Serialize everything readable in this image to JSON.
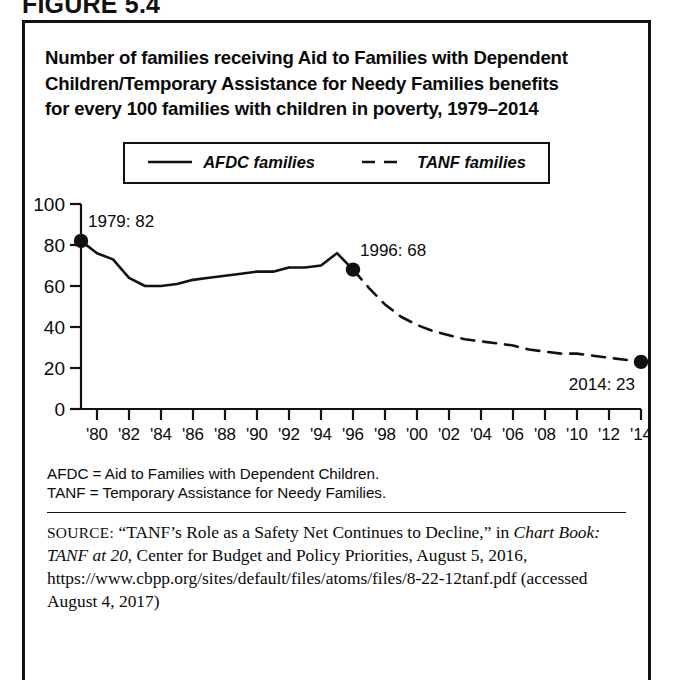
{
  "figure_label": "FIGURE 5.4",
  "title_lines": [
    "Number of families receiving Aid to Families with Dependent",
    "Children/Temporary Assistance for Needy Families benefits",
    "for every 100 families with children in poverty, 1979–2014"
  ],
  "legend": [
    {
      "label": "AFDC families",
      "style": "solid"
    },
    {
      "label": "TANF families",
      "style": "dashed"
    }
  ],
  "abbreviations": [
    "AFDC = Aid to Families with Dependent Children.",
    "TANF = Temporary Assistance for Needy Families."
  ],
  "source": {
    "prefix": "SOURCE:",
    "part1": " “TANF’s Role as a Safety Net Continues to Decline,” in ",
    "italic_title": "Chart Book: TANF at 20",
    "part2": ", Center for Budget and Policy Priorities, August 5, 2016, https://www.cbpp.org/sites/default/files/atoms/files/8-22-12tanf.pdf (accessed August 4, 2017)"
  },
  "chart_data": {
    "type": "line",
    "title": "Number of families receiving Aid to Families with Dependent Children/Temporary Assistance for Needy Families benefits for every 100 families with children in poverty, 1979–2014",
    "xlabel": "",
    "ylabel": "",
    "xlim": [
      1979,
      2014
    ],
    "ylim": [
      0,
      100
    ],
    "yticks": [
      0,
      20,
      40,
      60,
      80,
      100
    ],
    "ytick_labels": [
      "0",
      "20",
      "40",
      "60",
      "80",
      "100"
    ],
    "xticks": [
      1980,
      1982,
      1984,
      1986,
      1988,
      1990,
      1992,
      1994,
      1996,
      1998,
      2000,
      2002,
      2004,
      2006,
      2008,
      2010,
      2012,
      2014
    ],
    "xtick_labels": [
      "'80",
      "'82",
      "'84",
      "'86",
      "'88",
      "'90",
      "'92",
      "'94",
      "'96",
      "'98",
      "'00",
      "'02",
      "'04",
      "'06",
      "'08",
      "'10",
      "'12",
      "'14"
    ],
    "grid": false,
    "legend_position": "top-center",
    "series": [
      {
        "name": "AFDC families",
        "style": "solid",
        "x": [
          1979,
          1980,
          1981,
          1982,
          1983,
          1984,
          1985,
          1986,
          1987,
          1988,
          1989,
          1990,
          1991,
          1992,
          1993,
          1994,
          1995,
          1996
        ],
        "values": [
          82,
          76,
          73,
          64,
          60,
          60,
          61,
          63,
          64,
          65,
          66,
          67,
          67,
          69,
          69,
          70,
          76,
          68
        ]
      },
      {
        "name": "TANF families",
        "style": "dashed",
        "x": [
          1996,
          1997,
          1998,
          1999,
          2000,
          2001,
          2002,
          2003,
          2004,
          2005,
          2006,
          2007,
          2008,
          2009,
          2010,
          2011,
          2012,
          2013,
          2014
        ],
        "values": [
          68,
          59,
          51,
          45,
          41,
          38,
          36,
          34,
          33,
          32,
          31,
          29,
          28,
          27,
          27,
          26,
          25,
          24,
          23
        ]
      }
    ],
    "markers": [
      {
        "x": 1979,
        "y": 82,
        "label": "1979: 82",
        "label_position": "above-right"
      },
      {
        "x": 1996,
        "y": 68,
        "label": "1996: 68",
        "label_position": "above-right"
      },
      {
        "x": 2014,
        "y": 23,
        "label": "2014: 23",
        "label_position": "below-left"
      }
    ],
    "colors": {
      "line": "#111111",
      "marker": "#111111",
      "axis": "#111111"
    }
  }
}
